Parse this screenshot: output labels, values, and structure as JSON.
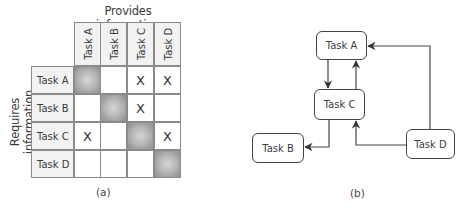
{
  "panel_a": {
    "column_axis_title": "Provides information",
    "row_axis_title": "Requires information",
    "columns": [
      "Task A",
      "Task B",
      "Task C",
      "Task D"
    ],
    "rows": [
      {
        "label": "Task A",
        "cells": [
          "",
          "",
          "X",
          "X"
        ]
      },
      {
        "label": "Task B",
        "cells": [
          "",
          "",
          "X",
          ""
        ]
      },
      {
        "label": "Task C",
        "cells": [
          "X",
          "",
          "",
          "X"
        ]
      },
      {
        "label": "Task D",
        "cells": [
          "",
          "",
          "",
          ""
        ]
      }
    ],
    "diagonal_shaded": true,
    "caption": "(a)"
  },
  "panel_b": {
    "nodes": [
      {
        "id": "A",
        "label": "Task A"
      },
      {
        "id": "B",
        "label": "Task B"
      },
      {
        "id": "C",
        "label": "Task C"
      },
      {
        "id": "D",
        "label": "Task D"
      }
    ],
    "edges": [
      {
        "from": "Task A",
        "to": "Task C"
      },
      {
        "from": "Task C",
        "to": "Task A"
      },
      {
        "from": "Task C",
        "to": "Task B"
      },
      {
        "from": "Task D",
        "to": "Task C"
      },
      {
        "from": "Task D",
        "to": "Task A"
      }
    ],
    "caption": "(b)"
  },
  "colors": {
    "header_fill": "#f2f2f2",
    "grid_line": "#8a8a8a",
    "diagonal_center": "#d6d6d6",
    "diagonal_edge": "#8e8e8e",
    "edge_line": "#444444"
  }
}
